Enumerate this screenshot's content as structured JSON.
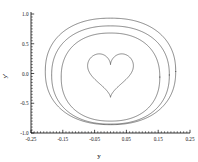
{
  "chart_data": {
    "type": "line",
    "title": "",
    "xlabel": "y",
    "ylabel": "y'",
    "xlim": [
      -0.25,
      0.25
    ],
    "ylim": [
      -1.0,
      1.0
    ],
    "grid": false,
    "legend": "none",
    "xticks": [
      -0.25,
      -0.15,
      -0.05,
      0.05,
      0.15,
      0.25
    ],
    "xticklabels": [
      "-0.25",
      "-0.15",
      "-0.05",
      "0.05",
      "0.15",
      "0.25"
    ],
    "yticks": [
      -1.0,
      -0.5,
      0.0,
      0.5,
      1.0
    ],
    "yticklabels": [
      "-1.0",
      "-0.5",
      "0.0",
      "0.5",
      "1.0"
    ],
    "minor_ticks": true,
    "tick_direction": "in",
    "spines": [
      "left",
      "bottom"
    ],
    "curve_color": "#4a4a4a",
    "background": "#ffffff",
    "series": [
      {
        "name": "outer-orbit",
        "description": "outermost closed orbit",
        "x_extent": [
          -0.205,
          0.205
        ],
        "y_extent": [
          -0.86,
          0.93
        ],
        "closed": true
      },
      {
        "name": "middle-orbit",
        "description": "second nested closed orbit",
        "x_extent": [
          -0.185,
          0.185
        ],
        "y_extent": [
          -0.85,
          0.8
        ],
        "closed": true
      },
      {
        "name": "inner-orbit",
        "description": "third nested closed orbit",
        "x_extent": [
          -0.155,
          0.155
        ],
        "y_extent": [
          -0.8,
          0.68
        ],
        "closed": true
      },
      {
        "name": "separatrix-heart",
        "description": "innermost heart-shaped separatrix with cusp at bottom center and dimple at top center",
        "x_extent": [
          -0.072,
          0.072
        ],
        "y_extent": [
          -0.4,
          0.33
        ],
        "cusp": [
          0.0,
          -0.4
        ],
        "dimple": [
          0.0,
          0.22
        ],
        "closed": true
      }
    ]
  }
}
